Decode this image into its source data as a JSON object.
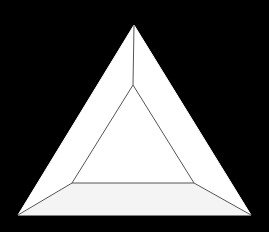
{
  "figure": {
    "type": "beveled-triangle",
    "width": 269,
    "height": 232,
    "colors": {
      "background": "#000000",
      "fill": "#ffffff",
      "stroke": "#555555"
    },
    "outer_triangle": {
      "apex": [
        134,
        25
      ],
      "bottom_left": [
        18,
        215
      ],
      "bottom_right": [
        251,
        215
      ]
    },
    "inner_triangle": {
      "apex": [
        133,
        85
      ],
      "bottom_left": [
        72,
        183
      ],
      "bottom_right": [
        194,
        183
      ]
    }
  }
}
